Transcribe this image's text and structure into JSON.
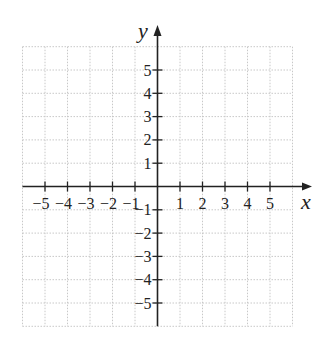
{
  "chart_data": {
    "type": "scatter",
    "title": "",
    "xlabel": "x",
    "ylabel": "y",
    "xlim": [
      -6,
      6
    ],
    "ylim": [
      -6,
      6
    ],
    "grid": true,
    "x_ticks": [
      -5,
      -4,
      -3,
      -2,
      -1,
      1,
      2,
      3,
      4,
      5
    ],
    "y_ticks": [
      5,
      4,
      3,
      2,
      1,
      -1,
      -2,
      -3,
      -4,
      -5
    ],
    "x_tick_labels": [
      "−5",
      "−4",
      "−3",
      "−2",
      "−1",
      "1",
      "2",
      "3",
      "4",
      "5"
    ],
    "y_tick_labels": [
      "5",
      "4",
      "3",
      "2",
      "1",
      "−1",
      "−2",
      "−3",
      "−4",
      "−5"
    ],
    "series": [],
    "legend": null
  },
  "colors": {
    "axis": "#222222",
    "grid": "#c8c8c8"
  }
}
